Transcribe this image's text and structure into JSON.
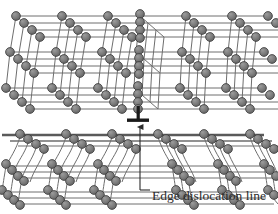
{
  "figure": {
    "type": "diagram",
    "background_color": "#ffffff"
  },
  "annotation": {
    "label": "Edge dislocation line",
    "leader_line": "leader-line",
    "arrow": "arrow-up",
    "dislocation_symbol": "⊥"
  },
  "colors": {
    "atom_fill": "#7a7a7a",
    "atom_fill_light": "#8d8d8d",
    "atom_stroke": "#3a3a3a",
    "bond": "#6e6e6e",
    "bond_dark": "#4a4a4a",
    "glide_plane": "#5a5a5a",
    "text": "#2b2b2b",
    "background": "#ffffff"
  },
  "lattice": {
    "atom_radius": 4.2,
    "chain_length": 4,
    "upper_rows": 3,
    "lower_rows": 3,
    "columns_left": 3,
    "columns_right": 3,
    "extra_half_plane_column": "center",
    "glide_plane_y": 117,
    "description": "Cubic lattice drawn in oblique perspective. Upper half contains an extra half-plane of atoms terminating at the dislocation core; lower half planes are bent around the core."
  },
  "geometry": {
    "width": 278,
    "height": 214,
    "depth_dx": 8,
    "depth_dy": 7,
    "col_spacing": 46,
    "row_spacing": 34
  }
}
